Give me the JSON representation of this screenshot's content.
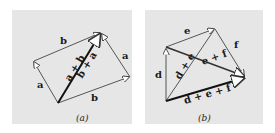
{
  "colors": {
    "page_background": "#ffffff",
    "panel_background": "#e6e6e6",
    "thin_vector": "#555555",
    "thick_vector": "#111111",
    "arrowhead_fill": "#ffffff"
  },
  "panel_a": {
    "caption": "(a)",
    "labels": {
      "b_top": "b",
      "a_left": "a",
      "a_right": "a",
      "b_bottom": "b",
      "sum_upper": "a + b",
      "sum_lower": "b + a"
    }
  },
  "panel_b": {
    "caption": "(b)",
    "labels": {
      "e": "e",
      "f": "f",
      "d": "d",
      "d_plus_e": "d + e",
      "e_plus_f": "e + f",
      "d_plus_e_plus_f": "d + e + f"
    }
  }
}
